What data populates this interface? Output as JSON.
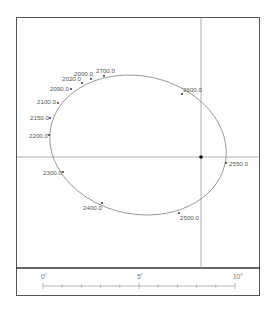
{
  "diagram": {
    "type": "orbit-track",
    "crosshair": {
      "x": 201,
      "y": 157
    },
    "center_marker": {
      "x": 201,
      "y": 157
    },
    "track_points": [
      {
        "label": "2700.0",
        "x": 104,
        "y": 76,
        "lx": 96,
        "ly": 73,
        "anchor": "start"
      },
      {
        "label": "2000.0",
        "x": 91,
        "y": 79,
        "lx": 74,
        "ly": 76,
        "anchor": "start"
      },
      {
        "label": "2020.0",
        "x": 82,
        "y": 83,
        "lx": 62,
        "ly": 81,
        "anchor": "start"
      },
      {
        "label": "2090.0",
        "x": 71,
        "y": 89,
        "lx": 50,
        "ly": 91,
        "anchor": "start"
      },
      {
        "label": "2100.0",
        "x": 58,
        "y": 103,
        "lx": 37,
        "ly": 104,
        "anchor": "start"
      },
      {
        "label": "2150.0",
        "x": 50,
        "y": 118,
        "lx": 30,
        "ly": 120,
        "anchor": "start"
      },
      {
        "label": "2200.0",
        "x": 49,
        "y": 135,
        "lx": 29,
        "ly": 138,
        "anchor": "start"
      },
      {
        "label": "2300.0",
        "x": 63,
        "y": 172,
        "lx": 43,
        "ly": 175,
        "anchor": "start"
      },
      {
        "label": "2400.0",
        "x": 102,
        "y": 203,
        "lx": 83,
        "ly": 210,
        "anchor": "start"
      },
      {
        "label": "2500.0",
        "x": 179,
        "y": 213,
        "lx": 180,
        "ly": 220,
        "anchor": "start"
      },
      {
        "label": "2550.0",
        "x": 226,
        "y": 163,
        "lx": 229,
        "ly": 166,
        "anchor": "start"
      },
      {
        "label": "2600.0",
        "x": 182,
        "y": 94,
        "lx": 183,
        "ly": 92,
        "anchor": "start"
      }
    ],
    "scale_bar": {
      "labels": [
        "0°",
        "5°",
        "10°"
      ],
      "x_start": 43,
      "x_end": 235,
      "y": 286,
      "divisions": 10
    }
  }
}
